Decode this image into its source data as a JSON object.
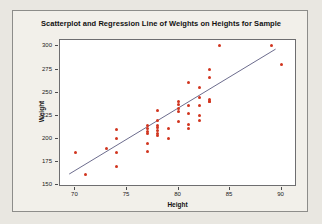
{
  "chart_data": {
    "type": "scatter",
    "title": "Scatterplot and Regression Line of Weights on Heights for Sample",
    "xlabel": "Height",
    "ylabel": "Weight",
    "xlim": [
      68.5,
      91.5
    ],
    "ylim": [
      148,
      307
    ],
    "xticks": [
      70,
      75,
      80,
      85,
      90
    ],
    "yticks": [
      150,
      175,
      200,
      225,
      250,
      275,
      300
    ],
    "grid": false,
    "legend": "none",
    "point_color": "#d1351f",
    "line_color": "#6a6a8c",
    "series": [
      {
        "name": "Weights on Heights",
        "marker": "circle",
        "points": [
          [
            70,
            185
          ],
          [
            71,
            162
          ],
          [
            73,
            190
          ],
          [
            74,
            210
          ],
          [
            74,
            200
          ],
          [
            74,
            185
          ],
          [
            74,
            170
          ],
          [
            77,
            214
          ],
          [
            77,
            211
          ],
          [
            77,
            208
          ],
          [
            77,
            206
          ],
          [
            77,
            195
          ],
          [
            77,
            186
          ],
          [
            78,
            231
          ],
          [
            78,
            220
          ],
          [
            78,
            215
          ],
          [
            78,
            212
          ],
          [
            78,
            209
          ],
          [
            78,
            206
          ],
          [
            78,
            204
          ],
          [
            79,
            211
          ],
          [
            79,
            200
          ],
          [
            80,
            240
          ],
          [
            80,
            237
          ],
          [
            80,
            233
          ],
          [
            80,
            230
          ],
          [
            80,
            219
          ],
          [
            81,
            261
          ],
          [
            81,
            236
          ],
          [
            81,
            228
          ],
          [
            81,
            216
          ],
          [
            81,
            211
          ],
          [
            82,
            256
          ],
          [
            82,
            245
          ],
          [
            82,
            236
          ],
          [
            82,
            225
          ],
          [
            82,
            220
          ],
          [
            83,
            275
          ],
          [
            83,
            266
          ],
          [
            83,
            243
          ],
          [
            83,
            241
          ],
          [
            83,
            240
          ],
          [
            84,
            301
          ],
          [
            89,
            301
          ],
          [
            90,
            281
          ]
        ]
      }
    ],
    "regression_line": {
      "x_start": 69.4,
      "y_start": 160,
      "x_end": 89.6,
      "y_end": 297
    }
  }
}
